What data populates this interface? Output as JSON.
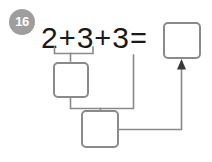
{
  "problem": {
    "number": "16",
    "badge_color": "#9e9e9e",
    "line_color": "#8a8a8a",
    "text_color": "#1a1a1a",
    "background": "#ffffff"
  },
  "equation": {
    "tokens": [
      "2",
      "+",
      "3",
      "+",
      "3",
      "="
    ],
    "operand_1": "2",
    "operand_2": "3",
    "operand_3": "3",
    "plus_1": "+",
    "plus_2": "+",
    "equals": "="
  },
  "boxes": {
    "partial_sum_1": {
      "label": "",
      "placeholder": ""
    },
    "partial_sum_2": {
      "label": "",
      "placeholder": ""
    },
    "answer": {
      "label": "",
      "placeholder": ""
    }
  },
  "connectors": {
    "bracket_first_pair": "2+3 grouped down into first box",
    "bracket_second": "first box and third addend grouped into second box",
    "arrow_to_answer": "second box result flows up into answer box"
  }
}
